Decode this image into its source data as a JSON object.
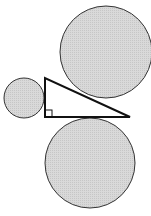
{
  "diagram": {
    "colors": {
      "background": "#ffffff",
      "circle_fill": "#d4d4d4",
      "circle_stroke": "#333333",
      "triangle_stroke": "#111111",
      "triangle_fill": "#ffffff"
    },
    "triangle": {
      "vertices": [
        [
          45,
          78
        ],
        [
          45,
          117
        ],
        [
          130,
          117
        ]
      ],
      "right_angle_vertex": [
        45,
        117
      ],
      "right_angle_marker_size": 7
    },
    "circles": [
      {
        "name": "small-circle-left",
        "cx": 24,
        "cy": 98,
        "r": 20,
        "tangent_to": "vertical leg"
      },
      {
        "name": "large-circle-top-right",
        "cx": 106,
        "cy": 52,
        "r": 46,
        "tangent_to": "hypotenuse"
      },
      {
        "name": "large-circle-bottom",
        "cx": 90,
        "cy": 163,
        "r": 45,
        "tangent_to": "horizontal leg"
      }
    ]
  }
}
